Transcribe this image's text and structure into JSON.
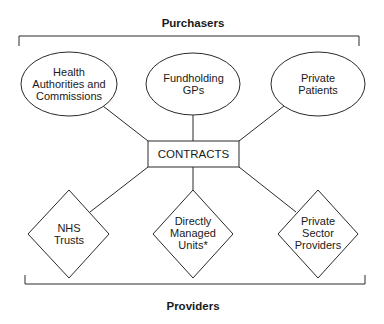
{
  "diagram": {
    "purchasers_label": "Purchasers",
    "providers_label": "Providers",
    "center": {
      "label": "CONTRACTS"
    },
    "purchasers": [
      {
        "line1": "Health",
        "line2": "Authorities and",
        "line3": "Commissions"
      },
      {
        "line1": "Fundholding",
        "line2": "GPs"
      },
      {
        "line1": "Private",
        "line2": "Patients"
      }
    ],
    "providers": [
      {
        "line1": "NHS",
        "line2": "Trusts"
      },
      {
        "line1": "Directly",
        "line2": "Managed",
        "line3": "Units*"
      },
      {
        "line1": "Private",
        "line2": "Sector",
        "line3": "Providers"
      }
    ],
    "stroke_color": "#2a2a2a"
  }
}
